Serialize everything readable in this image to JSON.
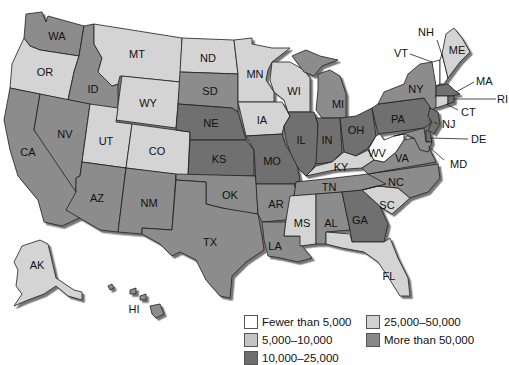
{
  "categories": {
    "c1": {
      "label": "Fewer than 5,000",
      "color": "#ffffff"
    },
    "c2": {
      "label": "5,000–10,000",
      "color": "#c9c9c9"
    },
    "c3": {
      "label": "10,000–25,000",
      "color": "#6f6f6f"
    },
    "c4": {
      "label": "25,000–50,000",
      "color": "#d4d4d4"
    },
    "c5": {
      "label": "More than 50,000",
      "color": "#8c8c8c"
    }
  },
  "legend": {
    "items": [
      {
        "label": "Fewer than 5,000",
        "color": "#ffffff"
      },
      {
        "label": "25,000–50,000",
        "color": "#d2d2d2"
      },
      {
        "label": "5,000–10,000",
        "color": "#c4c4c4"
      },
      {
        "label": "More than 50,000",
        "color": "#888888"
      },
      {
        "label": "10,000–25,000",
        "color": "#6e6e6e"
      }
    ]
  },
  "states": {
    "WA": {
      "label": "WA",
      "category": "c5"
    },
    "OR": {
      "label": "OR",
      "category": "c4"
    },
    "CA": {
      "label": "CA",
      "category": "c5"
    },
    "ID": {
      "label": "ID",
      "category": "c5"
    },
    "NV": {
      "label": "NV",
      "category": "c5"
    },
    "MT": {
      "label": "MT",
      "category": "c4"
    },
    "WY": {
      "label": "WY",
      "category": "c4"
    },
    "UT": {
      "label": "UT",
      "category": "c4"
    },
    "CO": {
      "label": "CO",
      "category": "c4"
    },
    "AZ": {
      "label": "AZ",
      "category": "c5"
    },
    "NM": {
      "label": "NM",
      "category": "c5"
    },
    "ND": {
      "label": "ND",
      "category": "c4"
    },
    "SD": {
      "label": "SD",
      "category": "c5"
    },
    "NE": {
      "label": "NE",
      "category": "c3"
    },
    "KS": {
      "label": "KS",
      "category": "c3"
    },
    "OK": {
      "label": "OK",
      "category": "c5"
    },
    "TX": {
      "label": "TX",
      "category": "c5"
    },
    "MN": {
      "label": "MN",
      "category": "c4"
    },
    "IA": {
      "label": "IA",
      "category": "c4"
    },
    "MO": {
      "label": "MO",
      "category": "c3"
    },
    "AR": {
      "label": "AR",
      "category": "c5"
    },
    "LA": {
      "label": "LA",
      "category": "c5"
    },
    "WI": {
      "label": "WI",
      "category": "c4"
    },
    "IL": {
      "label": "IL",
      "category": "c3"
    },
    "MI": {
      "label": "MI",
      "category": "c5"
    },
    "IN": {
      "label": "IN",
      "category": "c3"
    },
    "OH": {
      "label": "OH",
      "category": "c3"
    },
    "KY": {
      "label": "KY",
      "category": "c4"
    },
    "TN": {
      "label": "TN",
      "category": "c5"
    },
    "MS": {
      "label": "MS",
      "category": "c4"
    },
    "AL": {
      "label": "AL",
      "category": "c5"
    },
    "GA": {
      "label": "GA",
      "category": "c3"
    },
    "FL": {
      "label": "FL",
      "category": "c4"
    },
    "SC": {
      "label": "SC",
      "category": "c4"
    },
    "NC": {
      "label": "NC",
      "category": "c5"
    },
    "VA": {
      "label": "VA",
      "category": "c5"
    },
    "WV": {
      "label": "WV",
      "category": "c1"
    },
    "PA": {
      "label": "PA",
      "category": "c3"
    },
    "NY": {
      "label": "NY",
      "category": "c5"
    },
    "VT": {
      "label": "VT",
      "category": "c1"
    },
    "NH": {
      "label": "NH",
      "category": "c1"
    },
    "ME": {
      "label": "ME",
      "category": "c4"
    },
    "MA": {
      "label": "MA",
      "category": "c3"
    },
    "RI": {
      "label": "RI",
      "category": "c3"
    },
    "CT": {
      "label": "CT",
      "category": "c4"
    },
    "NJ": {
      "label": "NJ",
      "category": "c3"
    },
    "DE": {
      "label": "DE",
      "category": "c3"
    },
    "MD": {
      "label": "MD",
      "category": "c5"
    },
    "AK": {
      "label": "AK",
      "category": "c4"
    },
    "HI": {
      "label": "HI",
      "category": "c5"
    }
  }
}
